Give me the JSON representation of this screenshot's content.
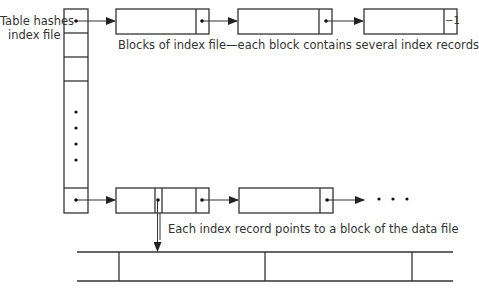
{
  "diagram": {
    "title_label": "Table hashes index file",
    "title_line1": "Table hashes",
    "title_line2": "index file",
    "index_blocks_caption": "Blocks of index file—each block contains several index records",
    "record_pointer_caption": "Each index record points to a block of the data file",
    "end_marker": "−1",
    "continuation": "• • •",
    "bottom_caption_cut_off": "",
    "colors": {
      "line": "#333333",
      "text": "#333333",
      "background": "#ffffff"
    },
    "hash_table": {
      "visible_slots": 5,
      "ellipsis_dots": 4
    },
    "top_chain": {
      "blocks": 3,
      "last_block_pointer": "−1"
    },
    "bottom_chain": {
      "blocks": 2,
      "continues": true
    },
    "data_file": {
      "segments_visible": 4
    }
  }
}
